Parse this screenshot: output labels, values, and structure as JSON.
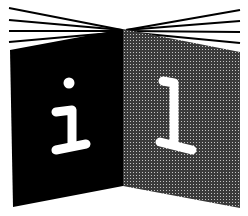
{
  "logo": {
    "description": "Open book information symbol",
    "left_page": {
      "glyph": "i",
      "fill": "#000000",
      "glyph_color": "#ffffff"
    },
    "right_page": {
      "glyph": "1",
      "fill": "#4a4a4a",
      "pattern": "halftone-dots",
      "glyph_color": "#ffffff"
    },
    "fan_lines": {
      "count_per_side": 4,
      "color": "#000000"
    },
    "colors": {
      "background": "#ffffff",
      "ink": "#000000",
      "halftone_dark": "#3a3a3a",
      "halftone_light": "#bdbdbd"
    }
  }
}
